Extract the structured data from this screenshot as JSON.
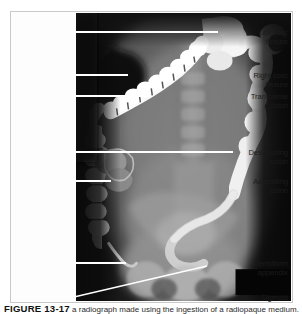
{
  "figure": {
    "number": "FIGURE 13-17",
    "caption_text": "  a radiograph made using the ingestion of a radiopaque medium.",
    "border_color": "#c9c9c9",
    "leader_line_color": "#ffffff",
    "label_text_color": "#1c1c1c",
    "background_color": "#ffffff"
  },
  "annotations": [
    {
      "id": "left-colic-flexure",
      "label": "Left colic\nflexure",
      "label_top": 16,
      "leader": {
        "x1": 63,
        "y1": 20,
        "x2": 207,
        "y2": 20,
        "diagonal": false
      }
    },
    {
      "id": "right-colic-flexure",
      "label": "Right colic\nflexure",
      "label_top": 59,
      "leader": {
        "x1": 63,
        "y1": 63,
        "x2": 117,
        "y2": 63,
        "diagonal": false
      }
    },
    {
      "id": "transverse-colon",
      "label": "Transverse\ncolon",
      "label_top": 80,
      "leader": {
        "x1": 63,
        "y1": 84,
        "x2": 139,
        "y2": 84,
        "diagonal": false
      }
    },
    {
      "id": "descending-colon",
      "label": "Descending\ncolon",
      "label_top": 136,
      "leader": {
        "x1": 63,
        "y1": 140,
        "x2": 222,
        "y2": 140,
        "diagonal": false
      }
    },
    {
      "id": "ascending-colon",
      "label": "Ascending\ncolon",
      "label_top": 165,
      "leader": {
        "x1": 63,
        "y1": 169,
        "x2": 100,
        "y2": 169,
        "diagonal": false
      }
    },
    {
      "id": "vermiform-appendix",
      "label": "Vermiform\nappendix",
      "label_top": 247,
      "leader": {
        "x1": 63,
        "y1": 251,
        "x2": 115,
        "y2": 251,
        "diagonal": false
      }
    },
    {
      "id": "sigmoid",
      "label": "Sigmoid",
      "label_top": 281,
      "leader": {
        "x1": 63,
        "y1": 285,
        "x2": 196,
        "y2": 254,
        "diagonal": true
      }
    }
  ],
  "radiograph": {
    "modality_marker": "black-rectangle-bottom-right",
    "description": "Barium contrast radiograph of the large intestine"
  }
}
